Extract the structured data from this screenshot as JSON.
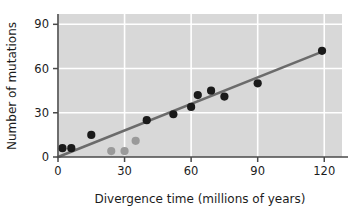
{
  "chart_data": {
    "type": "scatter",
    "title": "",
    "xlabel": "Divergence time (millions of years)",
    "ylabel": "Number of mutations",
    "xlim": [
      0,
      128
    ],
    "ylim": [
      0,
      97
    ],
    "xticks": [
      0,
      30,
      60,
      90,
      120
    ],
    "yticks": [
      0,
      30,
      60,
      90
    ],
    "xtick_labels": [
      "0",
      "30",
      "60",
      "90",
      "120"
    ],
    "ytick_labels": [
      "0",
      "30",
      "60",
      "90"
    ],
    "grid": true,
    "grid_color": "#ffffff",
    "plot_background": "#d8d8d8",
    "legend": null,
    "series": [
      {
        "name": "primary-data",
        "marker": "circle",
        "color": "#1a1a1a",
        "points": [
          {
            "x": 2,
            "y": 6
          },
          {
            "x": 6,
            "y": 6
          },
          {
            "x": 15,
            "y": 15
          },
          {
            "x": 40,
            "y": 25
          },
          {
            "x": 52,
            "y": 29
          },
          {
            "x": 60,
            "y": 34
          },
          {
            "x": 63,
            "y": 42
          },
          {
            "x": 69,
            "y": 45
          },
          {
            "x": 75,
            "y": 41
          },
          {
            "x": 90,
            "y": 50
          },
          {
            "x": 119,
            "y": 72
          }
        ]
      },
      {
        "name": "secondary-data",
        "marker": "circle",
        "color": "#9a9a9a",
        "points": [
          {
            "x": 24,
            "y": 4
          },
          {
            "x": 30,
            "y": 4
          },
          {
            "x": 35,
            "y": 11
          }
        ]
      }
    ],
    "trendline": {
      "name": "regression-line",
      "color": "#6b6b6b",
      "from": {
        "x": 0,
        "y": 0
      },
      "to": {
        "x": 120,
        "y": 72
      },
      "slope": 0.6,
      "intercept": 0
    }
  },
  "axes": {
    "x_title": "Divergence time (millions of years)",
    "y_title": "Number of mutations",
    "x_tick_labels": [
      "0",
      "30",
      "60",
      "90",
      "120"
    ],
    "y_tick_labels": [
      "0",
      "30",
      "60",
      "90"
    ]
  }
}
